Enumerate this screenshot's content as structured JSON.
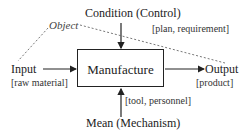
{
  "diagram": {
    "process": "Manufacture",
    "control": {
      "label": "Condition (Control)",
      "detail": "[plan, requirement]"
    },
    "input": {
      "label": "Input",
      "detail": "[raw material]"
    },
    "output": {
      "label": "Output",
      "detail": "[product]"
    },
    "mechanism": {
      "label": "Mean (Mechanism)",
      "detail": "[tool, personnel]"
    },
    "object_label": "Object"
  },
  "colors": {
    "line": "#222222",
    "dashed": "#555555"
  }
}
